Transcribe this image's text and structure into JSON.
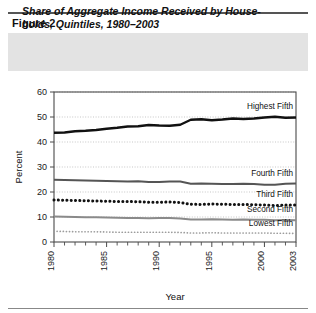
{
  "figure": {
    "number_label": "Figure 2",
    "title": "Share of Aggregate Income Received by House- holds, Quintiles, 1980–2003",
    "title_line1": "Share of Aggregate Income Received by House-",
    "title_line2": "holds, Quintiles, 1980–2003",
    "band_color": "#e3e3e3"
  },
  "chart_data": {
    "type": "line",
    "xlabel": "Year",
    "ylabel": "Percent",
    "ylim": [
      0,
      60
    ],
    "xlim": [
      1980,
      2003
    ],
    "yticks": [
      0,
      10,
      20,
      30,
      40,
      50,
      60
    ],
    "ytick_labels": [
      "0",
      "10",
      "20",
      "30",
      "40",
      "50",
      "60"
    ],
    "xticks": [
      1980,
      1985,
      1990,
      1995,
      2000,
      2003
    ],
    "xtick_labels": [
      "1980",
      "1985",
      "1990",
      "1995",
      "2000",
      "2003"
    ],
    "xtick_minor_step": 1,
    "grid": "horizontal-dotted",
    "legend_position": "inline-right-of-series",
    "x": [
      1980,
      1981,
      1982,
      1983,
      1984,
      1985,
      1986,
      1987,
      1988,
      1989,
      1990,
      1991,
      1992,
      1993,
      1994,
      1995,
      1996,
      1997,
      1998,
      1999,
      2000,
      2001,
      2002,
      2003
    ],
    "series": [
      {
        "name": "Highest Fifth",
        "label": "Highest Fifth",
        "color": "#111111",
        "style": "solid",
        "width": 2.4,
        "values": [
          43.7,
          43.8,
          44.3,
          44.5,
          44.8,
          45.3,
          45.7,
          46.2,
          46.3,
          46.8,
          46.6,
          46.5,
          46.9,
          48.9,
          49.1,
          48.7,
          49.0,
          49.4,
          49.2,
          49.4,
          49.8,
          50.1,
          49.7,
          49.8
        ]
      },
      {
        "name": "Fourth Fifth",
        "label": "Fourth Fifth",
        "color": "#555555",
        "style": "solid",
        "width": 1.9,
        "values": [
          24.9,
          24.8,
          24.7,
          24.6,
          24.5,
          24.4,
          24.3,
          24.2,
          24.3,
          24.0,
          24.0,
          24.2,
          24.2,
          23.3,
          23.4,
          23.3,
          23.2,
          23.2,
          23.3,
          23.2,
          22.9,
          22.9,
          23.3,
          23.4
        ]
      },
      {
        "name": "Third Fifth",
        "label": "Third Fifth",
        "color": "#111111",
        "style": "dotted-thick",
        "width": 3.0,
        "values": [
          16.8,
          16.7,
          16.6,
          16.5,
          16.4,
          16.3,
          16.2,
          16.2,
          16.1,
          15.9,
          15.9,
          16.0,
          15.8,
          15.1,
          15.0,
          15.2,
          15.1,
          15.0,
          15.0,
          14.9,
          14.8,
          14.6,
          14.8,
          14.8
        ]
      },
      {
        "name": "Second Fifth",
        "label": "Second Fifth",
        "color": "#8a8a8a",
        "style": "solid",
        "width": 1.9,
        "values": [
          10.2,
          10.1,
          10.0,
          9.9,
          9.9,
          9.8,
          9.7,
          9.6,
          9.6,
          9.5,
          9.6,
          9.6,
          9.4,
          9.0,
          9.0,
          9.1,
          9.0,
          8.9,
          9.0,
          8.9,
          8.9,
          8.7,
          8.8,
          8.7
        ]
      },
      {
        "name": "Lowest Fifth",
        "label": "Lowest Fifth",
        "color": "#9c9c9c",
        "style": "dotted-thin",
        "width": 1.7,
        "values": [
          4.3,
          4.2,
          4.1,
          4.1,
          4.1,
          4.0,
          3.9,
          3.9,
          3.9,
          3.9,
          3.9,
          3.9,
          3.8,
          3.6,
          3.6,
          3.7,
          3.6,
          3.6,
          3.6,
          3.6,
          3.6,
          3.5,
          3.5,
          3.4
        ]
      }
    ]
  }
}
